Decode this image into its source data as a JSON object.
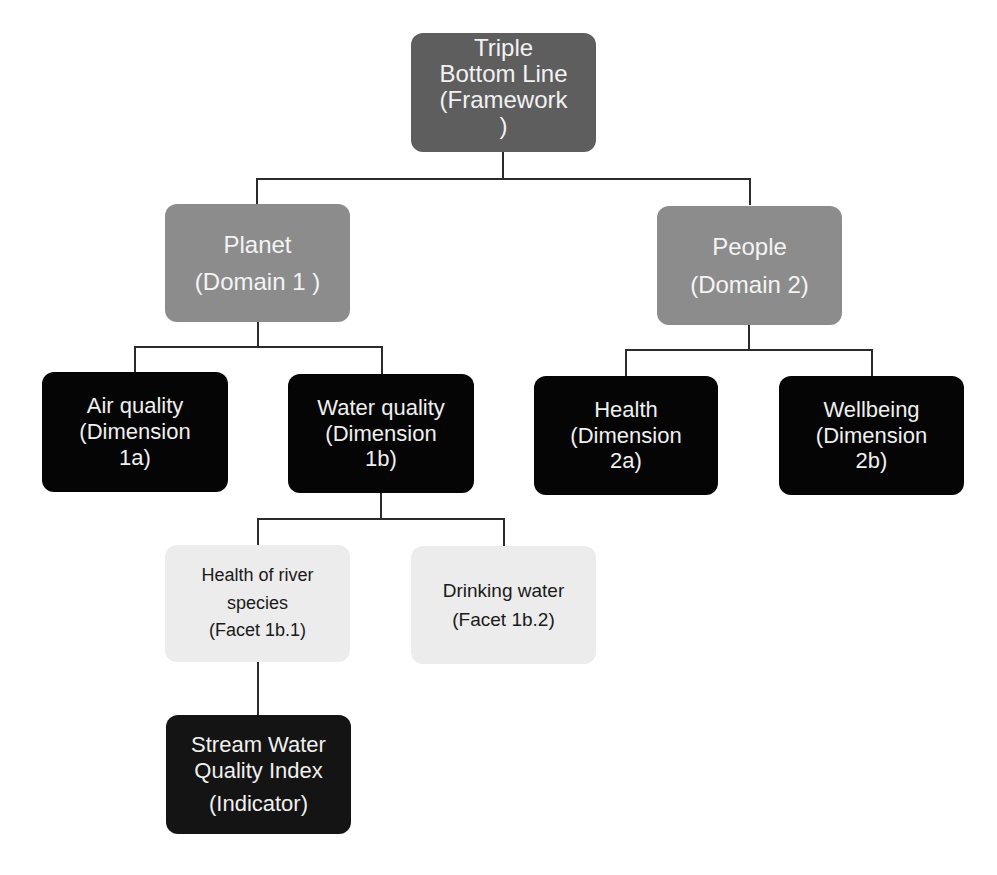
{
  "diagram": {
    "root": {
      "lines": [
        "Triple",
        "Bottom Line",
        "(Framework",
        ")"
      ]
    },
    "domains": [
      {
        "lines": [
          "Planet",
          "(Domain 1 )"
        ]
      },
      {
        "lines": [
          "People",
          "(Domain 2)"
        ]
      }
    ],
    "dimensions": [
      {
        "lines": [
          "Air quality",
          "(Dimension",
          "1a)"
        ]
      },
      {
        "lines": [
          "Water quality",
          "(Dimension",
          "1b)"
        ]
      },
      {
        "lines": [
          "Health",
          "(Dimension",
          "2a)"
        ]
      },
      {
        "lines": [
          "Wellbeing",
          "(Dimension",
          "2b)"
        ]
      }
    ],
    "facets": [
      {
        "lines": [
          "Health of river",
          "species",
          "(Facet 1b.1)"
        ]
      },
      {
        "lines": [
          "Drinking water",
          "(Facet 1b.2)"
        ]
      }
    ],
    "indicator": {
      "lines": [
        "Stream Water",
        "Quality Index",
        "(Indicator)"
      ]
    },
    "colors": {
      "root": "#5e5e5e",
      "domain": "#8c8c8c",
      "dimension": "#050505",
      "facet": "#ececec",
      "indicator": "#141414",
      "connector": "#2b2b2b"
    }
  }
}
